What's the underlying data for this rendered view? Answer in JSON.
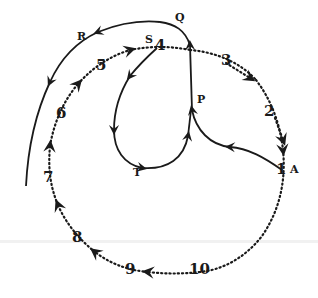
{
  "diagram": {
    "colors": {
      "ink": "#1a1a1a",
      "background": "#ffffff"
    },
    "circle_points": [
      {
        "label": "1",
        "x": 280,
        "y": 170
      },
      {
        "label": "2",
        "x": 268,
        "y": 112
      },
      {
        "label": "3",
        "x": 230,
        "y": 63
      },
      {
        "label": "4",
        "x": 158,
        "y": 49
      },
      {
        "label": "5",
        "x": 100,
        "y": 66
      },
      {
        "label": "6",
        "x": 60,
        "y": 114
      },
      {
        "label": "7",
        "x": 46,
        "y": 178
      },
      {
        "label": "8",
        "x": 76,
        "y": 237
      },
      {
        "label": "9",
        "x": 130,
        "y": 270
      },
      {
        "label": "10",
        "x": 198,
        "y": 270
      }
    ],
    "letters": [
      {
        "label": "A",
        "x": 290,
        "y": 170
      },
      {
        "label": "P",
        "x": 198,
        "y": 96
      },
      {
        "label": "Q",
        "x": 176,
        "y": 14
      },
      {
        "label": "R",
        "x": 78,
        "y": 34
      },
      {
        "label": "S",
        "x": 144,
        "y": 34
      },
      {
        "label": "T",
        "x": 133,
        "y": 170
      }
    ]
  }
}
